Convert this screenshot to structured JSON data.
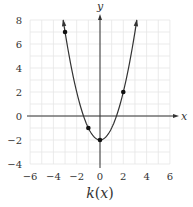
{
  "chart_data": {
    "type": "line",
    "title": "",
    "caption": "k(x)",
    "xlabel": "x",
    "ylabel": "y",
    "xlim": [
      -6,
      6
    ],
    "ylim": [
      -4,
      8
    ],
    "grid": true,
    "x_ticks": [
      -6,
      -4,
      -2,
      0,
      2,
      4,
      6
    ],
    "y_ticks": [
      -4,
      -2,
      0,
      2,
      4,
      6,
      8
    ],
    "x_tick_labels": [
      "−6",
      "−4",
      "−2",
      "0",
      "2",
      "4",
      "6"
    ],
    "y_tick_labels": [
      "−4",
      "−2",
      "0",
      "2",
      "4",
      "6",
      "8"
    ],
    "function": "k(x) = x^2 - 2",
    "series": [
      {
        "name": "k(x)",
        "curve_x_range": [
          -3.16,
          3.16
        ],
        "arrows_at_ends": true,
        "points": [
          {
            "x": -3,
            "y": 7
          },
          {
            "x": -1,
            "y": -1
          },
          {
            "x": 0,
            "y": -2
          },
          {
            "x": 2,
            "y": 2
          }
        ]
      }
    ]
  },
  "labels": {
    "x_axis": "x",
    "y_axis": "y",
    "caption_k": "k",
    "caption_open": "(",
    "caption_x": "x",
    "caption_close": ")"
  },
  "colors": {
    "grid": "#e6e6e6",
    "axis": "#333333",
    "curve": "#333333",
    "point": "#111111"
  }
}
